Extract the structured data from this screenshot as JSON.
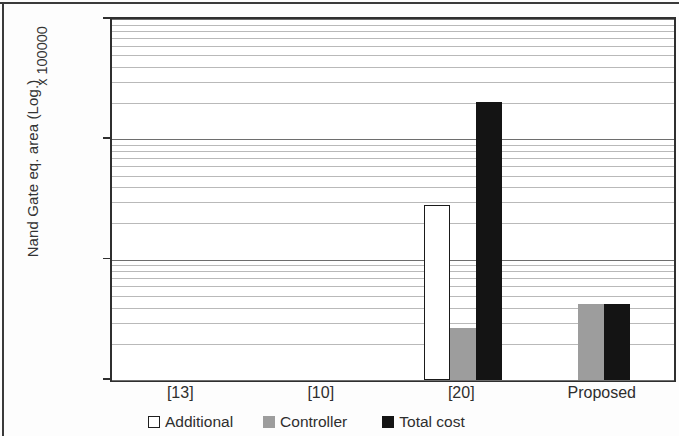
{
  "chart_data": {
    "type": "bar",
    "title": "",
    "subtitle": "",
    "xlabel": "",
    "ylabel": "Nand Gate eq. area (Log.)",
    "y_multiplier_label": "x 100000",
    "yscale": "log",
    "ylim": [
      1,
      1000
    ],
    "ytick_labels": [
      "1000",
      "100",
      "10",
      "1"
    ],
    "ytick_values": [
      1000,
      100,
      10,
      1
    ],
    "minor_gridlines": true,
    "grid": true,
    "legend_position": "bottom",
    "categories": [
      "[13]",
      "[10]",
      "[20]",
      "Proposed"
    ],
    "series": [
      {
        "name": "Additional",
        "color": "#ffffff",
        "edge_color": "#1a1a1a",
        "values": [
          null,
          null,
          28.3,
          null
        ]
      },
      {
        "name": "Controller",
        "color": "#9d9d9d",
        "edge_color": "#9d9d9d",
        "values": [
          null,
          null,
          2.7,
          4.3
        ]
      },
      {
        "name": "Total cost",
        "color": "#141414",
        "edge_color": "#141414",
        "values": [
          null,
          null,
          205.0,
          4.3
        ]
      }
    ]
  },
  "legend": {
    "items": [
      {
        "label": "Additional",
        "swatch": "white-square-icon"
      },
      {
        "label": "Controller",
        "swatch": "gray-square-icon"
      },
      {
        "label": "Total cost",
        "swatch": "black-square-icon"
      }
    ]
  },
  "axis": {
    "y_title": "Nand Gate eq. area (Log.)",
    "y_multiplier": "x 100000",
    "y_ticks": [
      "1000",
      "100",
      "10",
      "1"
    ],
    "x_ticks": [
      "[13]",
      "[10]",
      "[20]",
      "Proposed"
    ]
  }
}
